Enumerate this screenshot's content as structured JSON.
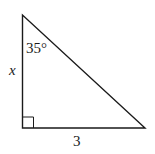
{
  "diagram": {
    "type": "right-triangle",
    "angle_label": "35°",
    "vertical_side_label": "x",
    "horizontal_side_label": "3",
    "right_angle_marker": true,
    "stroke_color": "#1a1a1a",
    "background": "#ffffff"
  }
}
